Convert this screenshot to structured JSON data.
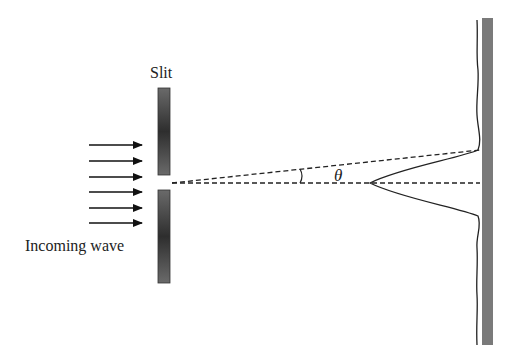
{
  "diagram": {
    "labels": {
      "slit": "Slit",
      "incoming_wave": "Incoming wave",
      "angle": "θ"
    },
    "incoming_arrows": {
      "count": 6
    },
    "colors": {
      "barrier": "#3a3a3a",
      "screen": "#7a7a7a",
      "line": "#1a1a1a"
    }
  }
}
